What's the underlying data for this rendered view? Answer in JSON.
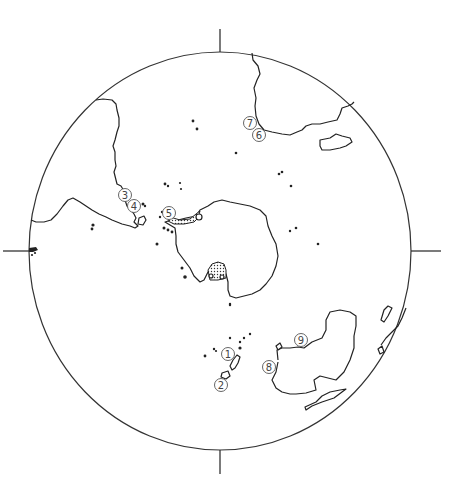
{
  "map": {
    "type": "polar-projection",
    "description": "South polar view with circular frame and four cardinal tick marks",
    "frame": {
      "cx": 220,
      "cy": 251,
      "rx": 191,
      "ry": 199
    },
    "markers": [
      {
        "id": "m1",
        "label": "1",
        "x": 228,
        "y": 354
      },
      {
        "id": "m2",
        "label": "2",
        "x": 221,
        "y": 385
      },
      {
        "id": "m3",
        "label": "3",
        "x": 125,
        "y": 195
      },
      {
        "id": "m4",
        "label": "4",
        "x": 134,
        "y": 206
      },
      {
        "id": "m5",
        "label": "5",
        "x": 169,
        "y": 213
      },
      {
        "id": "m6",
        "label": "6",
        "x": 259,
        "y": 135
      },
      {
        "id": "m7",
        "label": "7",
        "x": 250,
        "y": 123
      },
      {
        "id": "m8",
        "label": "8",
        "x": 269,
        "y": 367
      },
      {
        "id": "m9",
        "label": "9",
        "x": 301,
        "y": 340
      }
    ]
  }
}
